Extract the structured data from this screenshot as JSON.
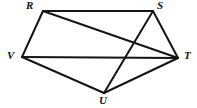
{
  "figure": {
    "name": "pentagon-with-diagonals",
    "type": "geometric-diagram",
    "background_color": "#ffffff",
    "stroke_color": "#151515",
    "stroke_width": 2,
    "label_color": "#121212",
    "canvas": {
      "width": 197,
      "height": 108
    },
    "vertices": [
      {
        "id": "R",
        "label": "R",
        "x": 43,
        "y": 11,
        "label_x": 26,
        "label_y": 0
      },
      {
        "id": "S",
        "label": "S",
        "x": 153,
        "y": 11,
        "label_x": 157,
        "label_y": 0
      },
      {
        "id": "T",
        "label": "T",
        "x": 178,
        "y": 58,
        "label_x": 184,
        "label_y": 50
      },
      {
        "id": "U",
        "label": "U",
        "x": 104,
        "y": 93,
        "label_x": 99,
        "label_y": 95
      },
      {
        "id": "V",
        "label": "V",
        "x": 22,
        "y": 57,
        "label_x": 7,
        "label_y": 50
      }
    ],
    "edges": [
      {
        "id": "RS",
        "from": "R",
        "to": "S",
        "kind": "side"
      },
      {
        "id": "ST",
        "from": "S",
        "to": "T",
        "kind": "side"
      },
      {
        "id": "TU",
        "from": "T",
        "to": "U",
        "kind": "side"
      },
      {
        "id": "UV",
        "from": "U",
        "to": "V",
        "kind": "side"
      },
      {
        "id": "VR",
        "from": "V",
        "to": "R",
        "kind": "side"
      },
      {
        "id": "VT",
        "from": "V",
        "to": "T",
        "kind": "diagonal"
      },
      {
        "id": "RT",
        "from": "R",
        "to": "T",
        "kind": "diagonal"
      },
      {
        "id": "SU",
        "from": "S",
        "to": "U",
        "kind": "diagonal"
      }
    ]
  }
}
